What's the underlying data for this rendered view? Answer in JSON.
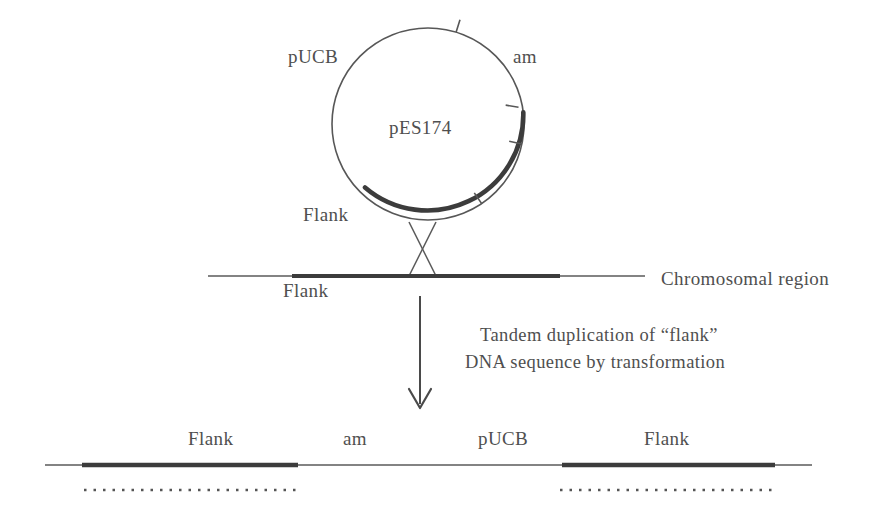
{
  "figure": {
    "type": "biology-diagram",
    "title_visible": false
  },
  "plasmid": {
    "name": "pES174",
    "label_pucb": "pUCB",
    "label_am": "am",
    "label_flank": "Flank",
    "center_x": 428,
    "center_y": 124,
    "radius": 96,
    "thin_color": "#4a4a4a",
    "thick_color": "#3c3c3c",
    "tick_marks": [
      {
        "angle_deg": -73,
        "length": 13
      },
      {
        "angle_deg": -10,
        "length": 13
      },
      {
        "angle_deg": 12,
        "length": 13
      },
      {
        "angle_deg": 56,
        "length": 13
      }
    ],
    "thick_arc_start_deg": -7,
    "thick_arc_end_deg": 131
  },
  "crossover": {
    "shown": true,
    "shape": "x-crossing"
  },
  "chromosome_line": {
    "label_right": "Chromosomal region",
    "label_below": "Flank",
    "x_start": 208,
    "x_end": 645,
    "y": 276,
    "thick_segment": {
      "x_start": 292,
      "x_end": 560
    }
  },
  "arrow": {
    "x": 420,
    "y_start": 296,
    "y_end": 408,
    "direction": "down"
  },
  "caption": {
    "line1": "Tandem duplication of “flank”",
    "line2": "DNA sequence by transformation"
  },
  "product_line": {
    "x_start": 45,
    "x_end": 812,
    "y": 465,
    "segments": [
      {
        "label": "Flank",
        "x_start": 82,
        "x_end": 298,
        "style": "thick",
        "dotted_below": true
      },
      {
        "label": "am",
        "x_start": 298,
        "x_end": 430,
        "style": "thin",
        "dotted_below": false
      },
      {
        "label": "pUCB",
        "x_start": 430,
        "x_end": 562,
        "style": "thin",
        "dotted_below": false
      },
      {
        "label": "Flank",
        "x_start": 562,
        "x_end": 775,
        "style": "thick",
        "dotted_below": true
      }
    ],
    "labels": [
      "Flank",
      "am",
      "pUCB",
      "Flank"
    ],
    "dotted_color": "#555555"
  },
  "colors": {
    "ink": "#4a4a4a",
    "thick_ink": "#3c3c3c",
    "background": "#ffffff"
  }
}
